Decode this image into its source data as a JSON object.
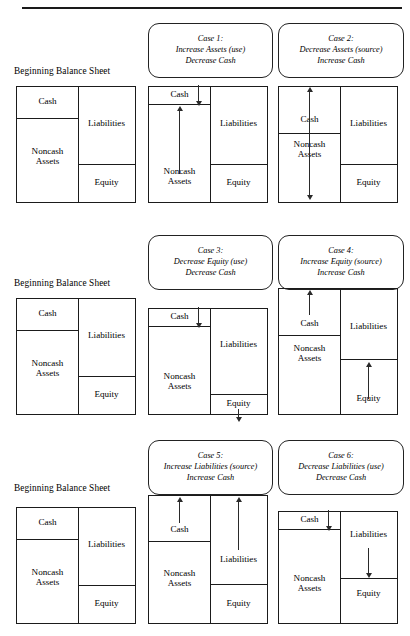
{
  "figure": {
    "labels": {
      "beginning_balance_sheet": "Beginning Balance Sheet",
      "cash": "Cash",
      "noncash_line1": "Noncash",
      "noncash_line2": "Assets",
      "liabilities": "Liabilities",
      "equity": "Equity"
    },
    "rows": [
      {
        "id": "row-0",
        "beginning_label": "Beginning Balance Sheet",
        "cases": [
          {
            "id": "case-1",
            "title": "Case 1:",
            "line2": "Increase Assets (use)",
            "line3": "Decrease Cash",
            "cash_change": "decrease",
            "counterpart": "noncash-assets",
            "counterpart_change": "increase"
          },
          {
            "id": "case-2",
            "title": "Case 2:",
            "line2": "Decrease Assets (source)",
            "line3": "Increase Cash",
            "cash_change": "increase",
            "counterpart": "noncash-assets",
            "counterpart_change": "decrease"
          }
        ]
      },
      {
        "id": "row-1",
        "beginning_label": "Beginning Balance Sheet",
        "cases": [
          {
            "id": "case-3",
            "title": "Case 3:",
            "line2": "Decrease Equity (use)",
            "line3": "Decrease Cash",
            "cash_change": "decrease",
            "counterpart": "equity",
            "counterpart_change": "decrease"
          },
          {
            "id": "case-4",
            "title": "Case 4:",
            "line2": "Increase Equity (source)",
            "line3": "Increase Cash",
            "cash_change": "increase",
            "counterpart": "equity",
            "counterpart_change": "increase"
          }
        ]
      },
      {
        "id": "row-2",
        "beginning_label": "Beginning Balance Sheet",
        "cases": [
          {
            "id": "case-5",
            "title": "Case 5:",
            "line2": "Increase Liabilities (source)",
            "line3": "Increase Cash",
            "cash_change": "increase",
            "counterpart": "liabilities",
            "counterpart_change": "increase"
          },
          {
            "id": "case-6",
            "title": "Case 6:",
            "line2": "Decrease Liabilities (use)",
            "line3": "Decrease Cash",
            "cash_change": "decrease",
            "counterpart": "liabilities",
            "counterpart_change": "decrease"
          }
        ]
      }
    ],
    "colors": {
      "ink": "#1b1b1b",
      "rule": "#1a1a1a",
      "arrow": "#2a2a2a",
      "background": "#ffffff"
    }
  }
}
